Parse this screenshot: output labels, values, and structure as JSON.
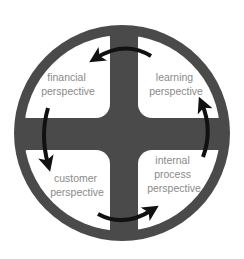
{
  "diagram": {
    "type": "balanced-scorecard-cycle",
    "colors": {
      "background": "#ffffff",
      "wheel": "#4a4a4a",
      "quadrant_fill": "#ffffff",
      "label": "#8a8a8a",
      "arrow": "#111111"
    },
    "quadrants": [
      {
        "id": "financial",
        "position": "top-left",
        "lines": [
          "financial",
          "perspective"
        ]
      },
      {
        "id": "learning",
        "position": "top-right",
        "lines": [
          "learning",
          "perspective"
        ]
      },
      {
        "id": "customer",
        "position": "bottom-left",
        "lines": [
          "customer",
          "perspective"
        ]
      },
      {
        "id": "internal-process",
        "position": "bottom-right",
        "lines": [
          "internal",
          "process",
          "perspective"
        ]
      }
    ],
    "arrows": [
      {
        "from": "learning",
        "to": "financial",
        "position": "top"
      },
      {
        "from": "financial",
        "to": "customer",
        "position": "left"
      },
      {
        "from": "customer",
        "to": "internal-process",
        "position": "bottom"
      },
      {
        "from": "internal-process",
        "to": "learning",
        "position": "right"
      }
    ]
  }
}
